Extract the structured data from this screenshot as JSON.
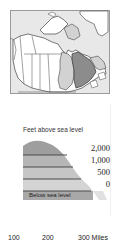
{
  "locator_map": {
    "region": "Canada",
    "highlighted": "Quebec",
    "colors": {
      "frame": "#9a9a9a",
      "land": "#ffffff",
      "water": "#e6e6e6",
      "highlight": "#8c8c8c",
      "neighbor": "#d2d2d2",
      "border": "#444444"
    }
  },
  "legend": {
    "title": "Feet above sea level",
    "levels": [
      {
        "label": "2,000",
        "color": "#9e9e9e"
      },
      {
        "label": "1,000",
        "color": "#b6b6b6"
      },
      {
        "label": "500",
        "color": "#c6c6c6"
      },
      {
        "label": "0",
        "color": "#d4d4d4"
      }
    ],
    "below": {
      "label": "Below sea level",
      "color": "#a8a8a8"
    },
    "line_color": "#4a4a4a"
  },
  "scale_bar": {
    "ticks": [
      "100",
      "200",
      "300"
    ],
    "unit": "Miles",
    "last_label": "300 Miles"
  }
}
